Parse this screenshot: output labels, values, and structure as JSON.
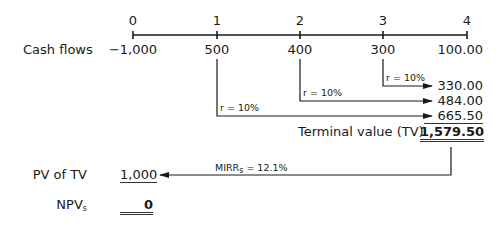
{
  "timeline": {
    "periods": [
      "0",
      "1",
      "2",
      "3",
      "4"
    ],
    "row_label": "Cash flows",
    "cash_flows": [
      "−1,000",
      "500",
      "400",
      "300",
      "100.00"
    ]
  },
  "compounding": {
    "rate_label": "r = 10%",
    "future_values": [
      "330.00",
      "484.00",
      "665.50"
    ]
  },
  "terminal_value": {
    "label": "Terminal value (TV)",
    "value": "1,579.50"
  },
  "discount": {
    "mirr_label": "MIRR",
    "mirr_sub": "s",
    "mirr_value": " = 12.1%"
  },
  "pv_of_tv": {
    "label": "PV of TV",
    "value": "1,000"
  },
  "npv": {
    "label": "NPV",
    "label_sub": "s",
    "value": "0"
  },
  "colors": {
    "line": "#1a1a1a",
    "text": "#1a1a1a"
  }
}
